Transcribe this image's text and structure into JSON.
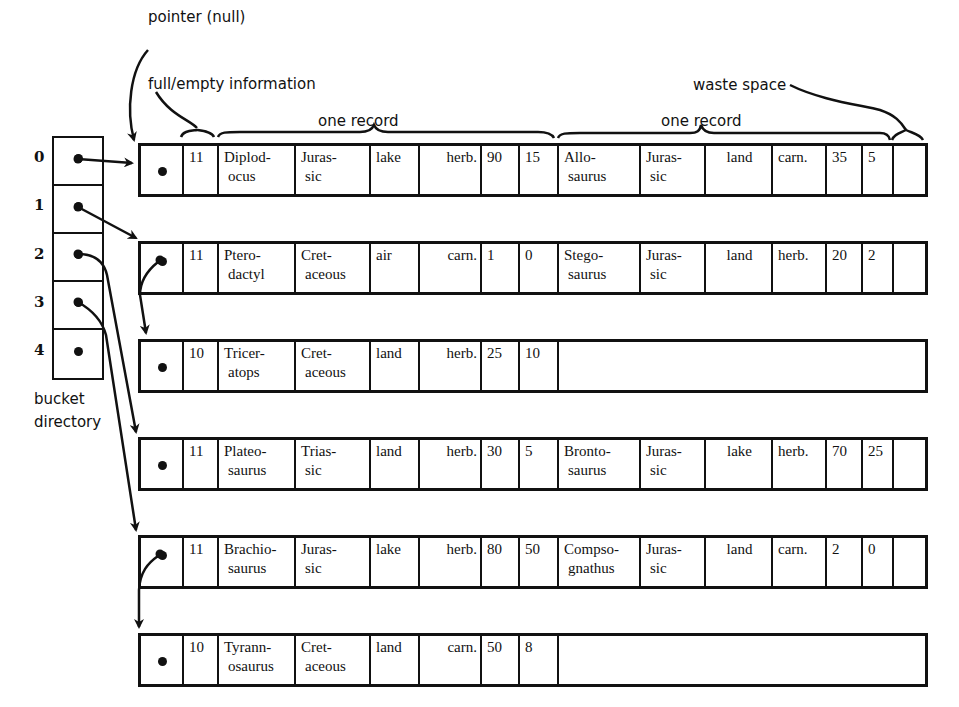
{
  "annotations": {
    "pointer_null": "pointer (null)",
    "full_empty": "full/empty information",
    "one_record_1": "one record",
    "one_record_2": "one record",
    "waste_space": "waste space",
    "bucket_directory_line1": "bucket",
    "bucket_directory_line2": "directory"
  },
  "directory": {
    "indices": [
      "0",
      "1",
      "2",
      "3",
      "4"
    ]
  },
  "buckets": [
    {
      "count": "11",
      "records": [
        {
          "name1": "Diplod-",
          "name2": "ocus",
          "period1": "Juras-",
          "period2": "sic",
          "habitat": "lake",
          "diet": "herb.",
          "n1": "90",
          "n2": "15"
        },
        {
          "name1": "Allo-",
          "name2": "saurus",
          "period1": "Juras-",
          "period2": "sic",
          "habitat": "land",
          "diet": "carn.",
          "n1": "35",
          "n2": "5"
        }
      ]
    },
    {
      "count": "11",
      "records": [
        {
          "name1": "Ptero-",
          "name2": "dactyl",
          "period1": "Cret-",
          "period2": "aceous",
          "habitat": "air",
          "diet": "carn.",
          "n1": "1",
          "n2": "0"
        },
        {
          "name1": "Stego-",
          "name2": "saurus",
          "period1": "Juras-",
          "period2": "sic",
          "habitat": "land",
          "diet": "herb.",
          "n1": "20",
          "n2": "2"
        }
      ]
    },
    {
      "count": "10",
      "records": [
        {
          "name1": "Tricer-",
          "name2": "atops",
          "period1": "Cret-",
          "period2": "aceous",
          "habitat": "land",
          "diet": "herb.",
          "n1": "25",
          "n2": "10"
        }
      ]
    },
    {
      "count": "11",
      "records": [
        {
          "name1": "Plateo-",
          "name2": "saurus",
          "period1": "Trias-",
          "period2": "sic",
          "habitat": "land",
          "diet": "herb.",
          "n1": "30",
          "n2": "5"
        },
        {
          "name1": "Bronto-",
          "name2": "saurus",
          "period1": "Juras-",
          "period2": "sic",
          "habitat": "lake",
          "diet": "herb.",
          "n1": "70",
          "n2": "25"
        }
      ]
    },
    {
      "count": "11",
      "records": [
        {
          "name1": "Brachio-",
          "name2": "saurus",
          "period1": "Juras-",
          "period2": "sic",
          "habitat": "lake",
          "diet": "herb.",
          "n1": "80",
          "n2": "50"
        },
        {
          "name1": "Compso-",
          "name2": "gnathus",
          "period1": "Juras-",
          "period2": "sic",
          "habitat": "land",
          "diet": "carn.",
          "n1": "2",
          "n2": "0"
        }
      ]
    },
    {
      "count": "10",
      "records": [
        {
          "name1": "Tyrann-",
          "name2": "osaurus",
          "period1": "Cret-",
          "period2": "aceous",
          "habitat": "land",
          "diet": "carn.",
          "n1": "50",
          "n2": "8"
        }
      ]
    }
  ]
}
